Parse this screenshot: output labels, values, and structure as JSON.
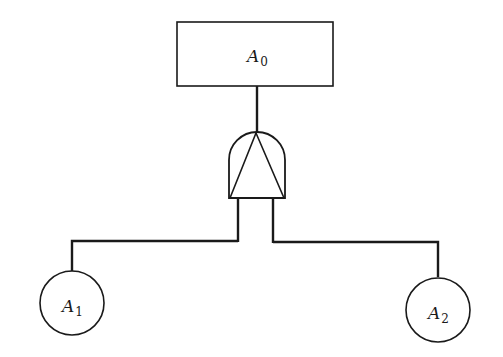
{
  "diagram": {
    "type": "fault-tree",
    "top_event": {
      "id": "A0",
      "base": "A",
      "subscript": "0",
      "shape": "rectangle"
    },
    "gate": {
      "type": "AND",
      "symbol": "and-gate-with-triangle"
    },
    "basic_events": [
      {
        "id": "A1",
        "base": "A",
        "subscript": "1",
        "shape": "circle"
      },
      {
        "id": "A2",
        "base": "A",
        "subscript": "2",
        "shape": "circle"
      }
    ],
    "edges": [
      {
        "from": "A0",
        "to": "gate"
      },
      {
        "from": "gate",
        "to": "A1"
      },
      {
        "from": "gate",
        "to": "A2"
      }
    ],
    "colors": {
      "stroke": "#1a1a1a",
      "background": "#ffffff"
    }
  }
}
